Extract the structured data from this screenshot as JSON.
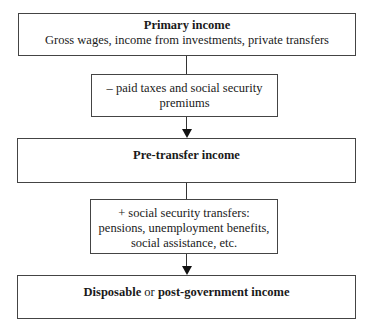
{
  "diagram": {
    "type": "flowchart",
    "direction": "top-to-bottom",
    "nodes": [
      {
        "id": "primary",
        "title": "Primary income",
        "subtitle": "Gross wages, income from investments, private transfers"
      },
      {
        "id": "deduct",
        "line1": "– paid taxes and social security",
        "line2": "premiums"
      },
      {
        "id": "pretransfer",
        "title": "Pre-transfer income"
      },
      {
        "id": "add",
        "line1": "+ social security transfers:",
        "line2": "pensions, unemployment benefits,",
        "line3": "social assistance, etc."
      },
      {
        "id": "disposable",
        "title_bold_1": "Disposable",
        "connector": " or ",
        "title_bold_2": "post-government income"
      }
    ],
    "edges": [
      {
        "from": "primary",
        "to": "deduct",
        "style": "line"
      },
      {
        "from": "deduct",
        "to": "pretransfer",
        "style": "arrow"
      },
      {
        "from": "pretransfer",
        "to": "add",
        "style": "line"
      },
      {
        "from": "add",
        "to": "disposable",
        "style": "arrow"
      }
    ]
  }
}
